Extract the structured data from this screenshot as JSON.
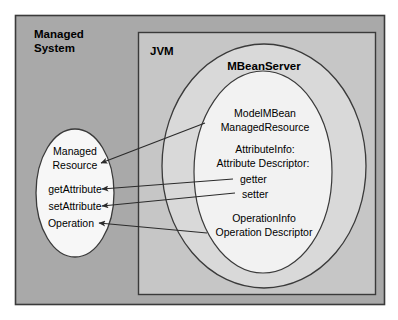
{
  "diagram": {
    "title_managed_system": "Managed\nSystem",
    "managed_system_label_line1": "Managed",
    "managed_system_label_line2": "System",
    "jvm_label": "JVM",
    "mbeanserver_label": "MBeanServer",
    "left_ellipse": {
      "name_line1": "Managed",
      "name_line2": "Resource",
      "items": [
        "getAttribute",
        "setAttribute",
        "Operation"
      ]
    },
    "inner_ellipse": {
      "group1": [
        "ModelMBean",
        "ManagedResource"
      ],
      "group2": [
        "AttributeInfo:",
        "Attribute Descriptor:",
        "getter",
        "setter"
      ],
      "group3": [
        "OperationInfo",
        "Operation Descriptor"
      ]
    },
    "connections": [
      {
        "from": "ManagedResource",
        "to": "Managed Resource"
      },
      {
        "from": "getter",
        "to": "getAttribute"
      },
      {
        "from": "setter",
        "to": "setAttribute"
      },
      {
        "from": "Operation Descriptor",
        "to": "Operation"
      }
    ],
    "colors": {
      "page_background": "#ffffff",
      "managed_system_fill": "#a9a9a9",
      "jvm_fill": "#c6c6c6",
      "mbeanserver_fill": "#d9d9d9",
      "inner_ellipse_fill": "#f2f2f2",
      "left_ellipse_fill": "#f7f7f7",
      "stroke": "#3a3a3a",
      "text": "#000000"
    }
  }
}
